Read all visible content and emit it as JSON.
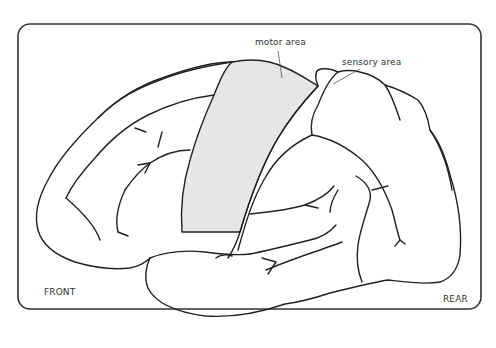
{
  "diagram": {
    "type": "brain-lateral-view",
    "labels": {
      "motor": "motor area",
      "sensory": "sensory area",
      "front": "FRONT",
      "rear": "REAR"
    },
    "colors": {
      "outline": "#222222",
      "frame": "#333333",
      "motor_fill": "#e6e6e6",
      "background": "#ffffff"
    }
  }
}
